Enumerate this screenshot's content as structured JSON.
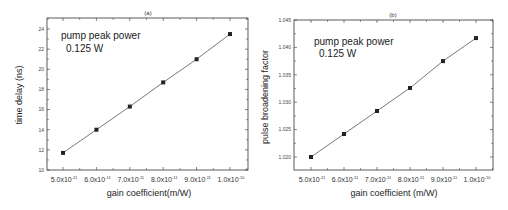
{
  "chart_data": [
    {
      "type": "line",
      "title": "(a)",
      "xlabel": "gain coefficient(m/W)",
      "ylabel": "time delay (ns)",
      "x": [
        5e-11,
        6e-11,
        7e-11,
        8e-11,
        9e-11,
        1e-10
      ],
      "x_tick_labels": [
        {
          "mant": "5.0x10",
          "exp": "-11"
        },
        {
          "mant": "6.0x10",
          "exp": "-11"
        },
        {
          "mant": "7.0x10",
          "exp": "-11"
        },
        {
          "mant": "8.0x10",
          "exp": "-11"
        },
        {
          "mant": "9.0x10",
          "exp": "-11"
        },
        {
          "mant": "1.0x10",
          "exp": "-10"
        }
      ],
      "series": [
        {
          "name": "time delay",
          "values": [
            11.7,
            14.0,
            16.3,
            18.7,
            21.0,
            23.5
          ],
          "marker": "square",
          "color": "#222222"
        }
      ],
      "ylim": [
        10,
        25
      ],
      "y_ticks": [
        "10",
        "12",
        "14",
        "16",
        "18",
        "20",
        "22",
        "24"
      ],
      "annotations": [
        "pump peak power",
        "0.125 W"
      ],
      "grid": false,
      "legend": "none"
    },
    {
      "type": "line",
      "title": "(b)",
      "xlabel": "gain coefficient (m/W)",
      "ylabel": "pulse broadening factor",
      "x": [
        5e-11,
        6e-11,
        7e-11,
        8e-11,
        9e-11,
        1e-10
      ],
      "x_tick_labels": [
        {
          "mant": "5.0x10",
          "exp": "-11"
        },
        {
          "mant": "6.0x10",
          "exp": "-11"
        },
        {
          "mant": "7.0x10",
          "exp": "-11"
        },
        {
          "mant": "8.0x10",
          "exp": "-11"
        },
        {
          "mant": "9.0x10",
          "exp": "-11"
        },
        {
          "mant": "1.0x10",
          "exp": "-10"
        }
      ],
      "series": [
        {
          "name": "pulse broadening factor",
          "values": [
            1.02,
            1.0242,
            1.0284,
            1.0326,
            1.0375,
            1.0417
          ],
          "marker": "square",
          "color": "#222222"
        }
      ],
      "ylim": [
        1.0175,
        1.045
      ],
      "y_ticks": [
        "1.020",
        "1.025",
        "1.030",
        "1.035",
        "1.040",
        "1.045"
      ],
      "annotations": [
        "pump peak power",
        "0.125 W"
      ],
      "grid": false,
      "legend": "none"
    }
  ]
}
